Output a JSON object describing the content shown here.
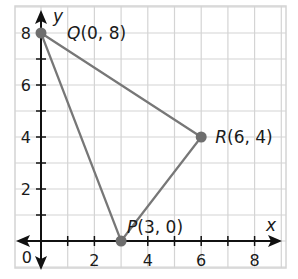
{
  "chart_data": {
    "type": "scatter",
    "title": "",
    "xlabel": "x",
    "ylabel": "y",
    "xlim": [
      -0.9,
      9.3
    ],
    "ylim": [
      -1,
      9
    ],
    "grid": true,
    "x_ticks": [
      "2",
      "4",
      "6",
      "8"
    ],
    "y_ticks": [
      "2",
      "4",
      "6",
      "8"
    ],
    "origin_label": "0",
    "points": [
      {
        "name": "Q",
        "x": 0,
        "y": 8,
        "label": "Q(0, 8)"
      },
      {
        "name": "R",
        "x": 6,
        "y": 4,
        "label": "R(6, 4)"
      },
      {
        "name": "P",
        "x": 3,
        "y": 0,
        "label": "P(3, 0)"
      }
    ],
    "polygon": [
      "Q",
      "R",
      "P"
    ]
  },
  "colors": {
    "grid": "#d4d4d4",
    "axis": "#111111",
    "triangle": "#777777",
    "point": "#6e6e6e"
  }
}
